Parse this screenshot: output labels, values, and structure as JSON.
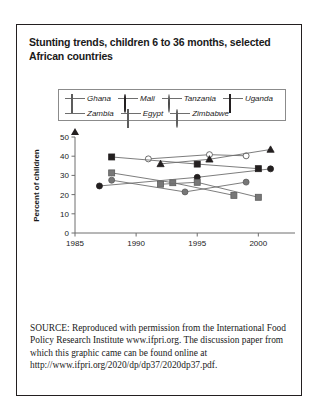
{
  "figure": {
    "title": "Stunting trends, children 6 to 36 months, selected African countries",
    "source_kicker": "SOURCE:",
    "source_text": " Reproduced with permission from the International Food Policy Research Institute www.ifpri.org. The discussion paper from which this graphic came can be found online at http://www.ifpri.org/2020/dp/dp37/2020dp37.pdf."
  },
  "colors": {
    "frame": "#231f20",
    "axis": "#6e6e6e",
    "line": "#6e6e6e",
    "dark_marker": "#231f20",
    "gray_marker": "#777777",
    "open_marker": "#ffffff",
    "text": "#1a1a1a"
  },
  "chart_data": {
    "type": "line",
    "title": "Stunting trends, children 6 to 36 months, selected African countries",
    "xlabel": "",
    "ylabel": "Percent of children",
    "xlim": [
      1985,
      2003
    ],
    "ylim": [
      0,
      50
    ],
    "xticks": [
      1985,
      1990,
      1995,
      2000
    ],
    "yticks": [
      0,
      10,
      20,
      30,
      40,
      50
    ],
    "grid": false,
    "legend_position": "top",
    "series": [
      {
        "name": "Ghana",
        "marker": "square",
        "marker_fill": "gray",
        "x": [
          1988,
          1993,
          1998
        ],
        "values": [
          31.3,
          26.2,
          19.6
        ]
      },
      {
        "name": "Mali",
        "marker": "circle",
        "marker_fill": "black",
        "x": [
          1987,
          1995,
          2001
        ],
        "values": [
          24.5,
          29.0,
          33.4
        ]
      },
      {
        "name": "Tanzania",
        "marker": "circle",
        "marker_fill": "open",
        "x": [
          1991,
          1996,
          1999
        ],
        "values": [
          38.6,
          40.8,
          40.2
        ]
      },
      {
        "name": "Uganda",
        "marker": "square",
        "marker_fill": "black",
        "x": [
          1988,
          1995,
          2000
        ],
        "values": [
          39.6,
          35.9,
          33.5
        ]
      },
      {
        "name": "Zambia",
        "marker": "triangle",
        "marker_fill": "black",
        "x": [
          1992,
          1996,
          2001
        ],
        "values": [
          36.0,
          38.4,
          43.5
        ]
      },
      {
        "name": "Egypt",
        "marker": "square",
        "marker_fill": "gray",
        "x": [
          1992,
          1995,
          2000
        ],
        "values": [
          25.4,
          26.4,
          18.6
        ]
      },
      {
        "name": "Zimbabwe",
        "marker": "circle",
        "marker_fill": "gray",
        "x": [
          1988,
          1994,
          1999
        ],
        "values": [
          27.5,
          21.4,
          26.5
        ]
      }
    ]
  },
  "legend": {
    "row1": [
      {
        "label": "Ghana",
        "marker": "square",
        "fill": "gray"
      },
      {
        "label": "Mali",
        "marker": "circle",
        "fill": "black"
      },
      {
        "label": "Tanzania",
        "marker": "circle",
        "fill": "open"
      },
      {
        "label": "Uganda",
        "marker": "square",
        "fill": "black"
      }
    ],
    "row2": [
      {
        "label": "Zambia",
        "marker": "triangle",
        "fill": "black"
      },
      {
        "label": "Egypt",
        "marker": "square",
        "fill": "gray"
      },
      {
        "label": "Zimbabwe",
        "marker": "circle",
        "fill": "gray"
      }
    ]
  }
}
